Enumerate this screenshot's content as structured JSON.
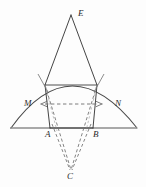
{
  "figure": {
    "kind": "geometry-diagram",
    "caption": "",
    "canvas": {
      "width": 146,
      "height": 187
    },
    "background_color": "#fdfdfd",
    "stroke_color": "#3a3a3a",
    "arc_stroke_color": "#4a4a4a",
    "dashed_stroke_color": "#6e6e6e",
    "baseline_stroke_color": "#8c8c8c",
    "label_color": "#2b2b2b"
  },
  "labels": {
    "apex": "E",
    "arc_left_inner": "M",
    "arc_right_inner": "N",
    "base_left": "A",
    "base_right": "B",
    "below_base": "C"
  },
  "points": {
    "E": {
      "x": 71,
      "y": 15,
      "label": "E"
    },
    "P": {
      "x": 45,
      "y": 85,
      "label": ""
    },
    "Q": {
      "x": 97,
      "y": 85,
      "label": ""
    },
    "M": {
      "x": 33,
      "y": 105,
      "label": "M"
    },
    "N": {
      "x": 112,
      "y": 105,
      "label": "N"
    },
    "A": {
      "x": 50,
      "y": 128,
      "label": "A"
    },
    "B": {
      "x": 93,
      "y": 128,
      "label": "B"
    },
    "C": {
      "x": 71,
      "y": 172,
      "label": "C"
    },
    "arc_left_end": {
      "x": 11,
      "y": 128,
      "label": ""
    },
    "arc_right_end": {
      "x": 137,
      "y": 128,
      "label": ""
    },
    "arc_apex": {
      "x": 71,
      "y": 80,
      "label": ""
    }
  },
  "solid_edges": [
    {
      "name": "E-to-left-arc",
      "from": "E",
      "to": "P"
    },
    {
      "name": "E-to-right-arc",
      "from": "E",
      "to": "Q"
    },
    {
      "name": "left-side",
      "from": "P",
      "to": "A"
    },
    {
      "name": "right-side",
      "from": "Q",
      "to": "B"
    },
    {
      "name": "base-chord-AB",
      "from": "A",
      "to": "B"
    },
    {
      "name": "top-chord-PQ",
      "from": "P",
      "to": "Q"
    }
  ],
  "dashed_edges": [
    {
      "name": "left-arc-to-C",
      "from": "P",
      "to": "C"
    },
    {
      "name": "right-arc-to-C",
      "from": "Q",
      "to": "C"
    },
    {
      "name": "A-to-C",
      "from": "A",
      "to": "C"
    },
    {
      "name": "B-to-C",
      "from": "B",
      "to": "C"
    },
    {
      "name": "MN-horizontal",
      "from": "M",
      "to": "N"
    }
  ],
  "arcs": [
    {
      "name": "main-arc",
      "from": "arc_left_end",
      "through": "arc_apex",
      "to": "arc_right_end"
    }
  ],
  "baseline": {
    "name": "baseline",
    "x1": 10,
    "x2": 137,
    "y": 128
  },
  "arrow_markers": [
    {
      "name": "arrow-toward-M",
      "direction": "left",
      "x": 44,
      "y": 104
    },
    {
      "name": "arrow-toward-N",
      "direction": "right",
      "x": 98,
      "y": 104
    }
  ],
  "tick_marks": [
    {
      "name": "tick-left-upper",
      "x": 40,
      "y": 78
    },
    {
      "name": "tick-right-upper",
      "x": 101,
      "y": 78
    }
  ]
}
